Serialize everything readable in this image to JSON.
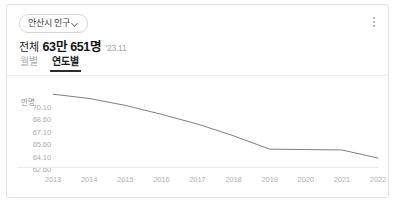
{
  "card": {
    "region_selector": {
      "label": "안산시 인구",
      "icon": "chevron-down-icon"
    },
    "menu_icon": "kebab-menu-icon",
    "summary": {
      "lead": "전체",
      "value": "63만 651명",
      "period": "'23.11"
    },
    "tabs": [
      {
        "label": "월별",
        "active": false
      },
      {
        "label": "연도별",
        "active": true
      }
    ]
  },
  "chart_data": {
    "type": "line",
    "title": "",
    "xlabel": "",
    "ylabel": "만명",
    "categories": [
      "2013",
      "2014",
      "2015",
      "2016",
      "2017",
      "2018",
      "2019",
      "2020",
      "2021",
      "2022"
    ],
    "series": [
      {
        "name": "안산시 인구",
        "values": [
          71.58,
          71.05,
          70.2,
          69.1,
          67.9,
          66.45,
          64.8,
          64.75,
          64.7,
          63.7
        ]
      }
    ],
    "ylim": [
      62.6,
      71.6
    ],
    "yticks": [
      "70.10",
      "68.60",
      "67.10",
      "65.60",
      "64.10",
      "62.60"
    ],
    "ytick_values": [
      70.1,
      68.6,
      67.1,
      65.6,
      64.1,
      62.6
    ],
    "grid": false,
    "legend": "none",
    "line_color": "#6f7075"
  }
}
